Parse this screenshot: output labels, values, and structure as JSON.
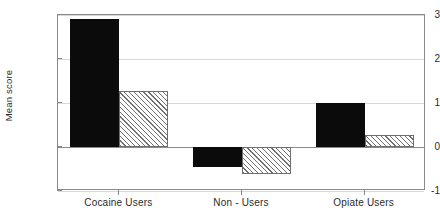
{
  "chart_data": {
    "type": "bar",
    "title": "",
    "xlabel": "",
    "ylabel": "Mean score",
    "categories": [
      "Cocaine Users",
      "Non - Users",
      "Opiate Users"
    ],
    "series": [
      {
        "name": "series-solid-black",
        "style": "solid-black",
        "values": [
          2.9,
          -0.45,
          1.0
        ]
      },
      {
        "name": "series-hatched",
        "style": "diagonal-hatch",
        "values": [
          1.27,
          -0.62,
          0.27
        ]
      }
    ],
    "ylim": [
      -1,
      3
    ],
    "yticks": [
      3,
      2,
      1,
      0,
      -1
    ],
    "ytick_labels": [
      "3",
      "2",
      "1",
      "0",
      "-1"
    ],
    "grid": true,
    "legend": "none",
    "colors": {
      "series_solid": "#0b0b0b",
      "series_hatch_line": "#6e6e6e",
      "series_hatch_fill": "#ffffff",
      "axis": "#8a8a8a",
      "gridline": "#d8d8d8",
      "text": "#2b2b2b",
      "background": "#ffffff"
    }
  }
}
